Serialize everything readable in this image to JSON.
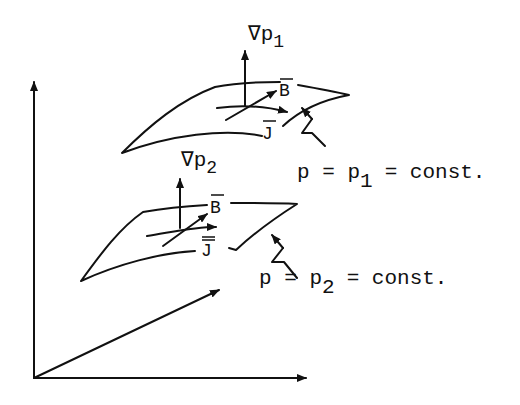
{
  "figure": {
    "surface_top": {
      "gradient_label": "∇p",
      "gradient_subscript": "1",
      "b_label": "B",
      "j_label": "J",
      "equation_lhs": "p = p",
      "equation_subscript": "1",
      "equation_rhs": "= const."
    },
    "surface_bottom": {
      "gradient_label": "∇p",
      "gradient_subscript": "2",
      "b_label": "B",
      "j_label": "J",
      "equation_lhs": "p = p",
      "equation_subscript": "2",
      "equation_rhs": "= const."
    },
    "colors": {
      "ink": "#111111",
      "background": "#ffffff"
    }
  }
}
